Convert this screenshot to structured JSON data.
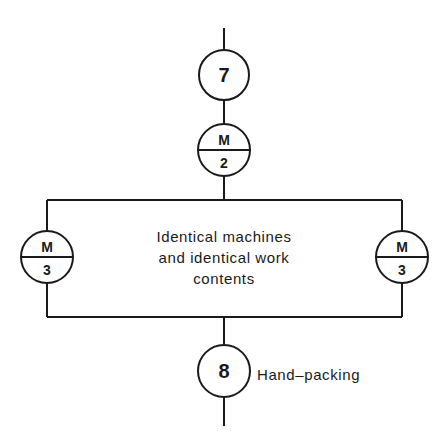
{
  "diagram": {
    "type": "flow-process-chart",
    "nodes": [
      {
        "id": "op7",
        "shape": "circle",
        "label": "7"
      },
      {
        "id": "m2",
        "shape": "split-circle",
        "top": "M",
        "bottom": "2"
      },
      {
        "id": "m3_left",
        "shape": "split-circle",
        "top": "M",
        "bottom": "3"
      },
      {
        "id": "m3_right",
        "shape": "split-circle",
        "top": "M",
        "bottom": "3"
      },
      {
        "id": "op8",
        "shape": "circle",
        "label": "8"
      }
    ],
    "parallel_box": {
      "lines": [
        "Identical machines",
        "and identical work",
        "contents"
      ]
    },
    "op8_annotation": "Hand–packing",
    "colors": {
      "line": "#1a1a1a",
      "background": "#ffffff"
    }
  }
}
